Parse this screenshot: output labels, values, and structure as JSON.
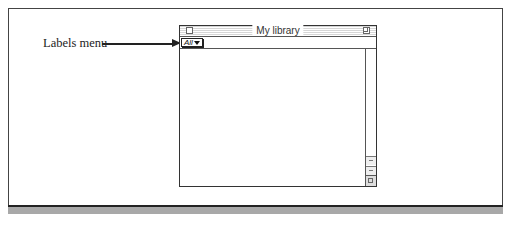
{
  "callout": {
    "label": "Labels menu"
  },
  "window": {
    "title": "My library",
    "labels_menu": {
      "selected": "All",
      "icon": "triangle-down-icon"
    },
    "controls": {
      "close": "close-box-icon",
      "zoom": "zoom-box-icon",
      "grow": "grow-box-icon"
    }
  }
}
